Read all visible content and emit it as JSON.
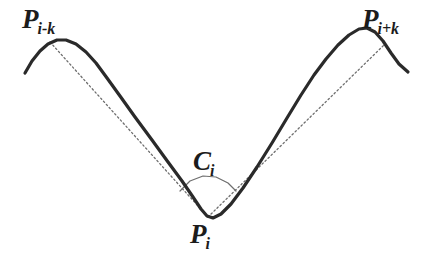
{
  "figure": {
    "background_color": "#ffffff",
    "curve_color": "#2a2a2a",
    "chord_color": "#6e6e6e",
    "arc_color": "#6e6e6e",
    "label_color": "#1c1c1c",
    "labels": {
      "left_peak": {
        "base": "P",
        "sub": "i-k",
        "name": "p-i-minus-k"
      },
      "right_peak": {
        "base": "P",
        "sub": "i+k",
        "name": "p-i-plus-k"
      },
      "vertex": {
        "base": "P",
        "sub": "i",
        "name": "p-i"
      },
      "angle": {
        "base": "C",
        "sub": "i",
        "name": "c-i"
      }
    }
  },
  "chart_data": {
    "type": "line",
    "xlabel": "",
    "ylabel": "",
    "xlim": [
      0,
      442
    ],
    "ylim": [
      254,
      0
    ],
    "grid": false,
    "legend": "none",
    "series": [
      {
        "name": "signal-curve",
        "style": "solid",
        "color": "#2a2a2a",
        "width": 3.2,
        "points": [
          [
            25,
            73
          ],
          [
            32,
            61
          ],
          [
            40,
            51
          ],
          [
            48,
            44
          ],
          [
            57,
            40
          ],
          [
            66,
            40
          ],
          [
            76,
            44
          ],
          [
            86,
            52
          ],
          [
            96,
            63
          ],
          [
            107,
            78
          ],
          [
            120,
            96
          ],
          [
            135,
            117
          ],
          [
            152,
            140
          ],
          [
            168,
            162
          ],
          [
            182,
            181
          ],
          [
            193,
            197
          ],
          [
            201,
            209
          ],
          [
            207,
            216
          ],
          [
            213,
            218
          ],
          [
            221,
            214
          ],
          [
            231,
            204
          ],
          [
            243,
            188
          ],
          [
            257,
            167
          ],
          [
            272,
            143
          ],
          [
            287,
            118
          ],
          [
            301,
            95
          ],
          [
            314,
            75
          ],
          [
            326,
            59
          ],
          [
            338,
            45
          ],
          [
            349,
            35
          ],
          [
            359,
            29
          ],
          [
            367,
            28
          ],
          [
            375,
            32
          ],
          [
            383,
            41
          ],
          [
            391,
            53
          ],
          [
            399,
            64
          ],
          [
            408,
            72
          ]
        ]
      },
      {
        "name": "chord-left",
        "style": "dotted",
        "color": "#6e6e6e",
        "width": 1.3,
        "points": [
          [
            50,
            42
          ],
          [
            208,
            217
          ]
        ]
      },
      {
        "name": "chord-right",
        "style": "dotted",
        "color": "#6e6e6e",
        "width": 1.3,
        "points": [
          [
            208,
            217
          ],
          [
            385,
            44
          ]
        ]
      },
      {
        "name": "angle-arc",
        "style": "solid",
        "color": "#6e6e6e",
        "width": 1.2,
        "points": [
          [
            180,
            191
          ],
          [
            190,
            181
          ],
          [
            203,
            176
          ],
          [
            216,
            177
          ],
          [
            228,
            183
          ],
          [
            236,
            191
          ]
        ]
      }
    ],
    "annotations": [
      {
        "text": "P i-k",
        "x": 22,
        "y": 6,
        "name": "p-i-minus-k"
      },
      {
        "text": "P i+k",
        "x": 362,
        "y": 6,
        "name": "p-i-plus-k"
      },
      {
        "text": "C i",
        "x": 193,
        "y": 148,
        "name": "c-i"
      },
      {
        "text": "P i",
        "x": 190,
        "y": 221,
        "name": "p-i"
      }
    ]
  }
}
